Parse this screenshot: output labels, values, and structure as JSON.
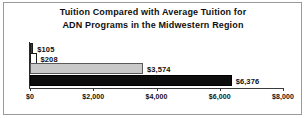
{
  "chart_data": {
    "type": "bar",
    "orientation": "horizontal",
    "title": "Tuition Compared with Average Tuition for ADN Programs in the Midwestern Region",
    "title_line1": "Tuition Compared with Average Tuition for",
    "title_line2": "ADN Programs in the Midwestern Region",
    "xlabel": "",
    "ylabel": "",
    "categories": [
      "",
      "",
      "",
      ""
    ],
    "values": [
      105,
      208,
      3574,
      6376
    ],
    "data_labels": [
      "$105",
      "$208",
      "$3,574",
      "$6,376"
    ],
    "bar_colors": [
      "#3c3c3c",
      "#ffffff",
      "#c9c9c9",
      "#0d0d0d"
    ],
    "xlim": [
      0,
      8000
    ],
    "xticks": [
      0,
      2000,
      4000,
      6000,
      8000
    ],
    "xtick_labels": [
      "$0",
      "$2,000",
      "$4,000",
      "$6,000",
      "$8,000"
    ],
    "grid": false,
    "legend": false,
    "bars": [
      {
        "label": "$105",
        "value": 105,
        "color": "#3c3c3c"
      },
      {
        "label": "$208",
        "value": 208,
        "color": "#ffffff"
      },
      {
        "label": "$3,574",
        "value": 3574,
        "color": "#c9c9c9"
      },
      {
        "label": "$6,376",
        "value": 6376,
        "color": "#0d0d0d"
      }
    ]
  }
}
